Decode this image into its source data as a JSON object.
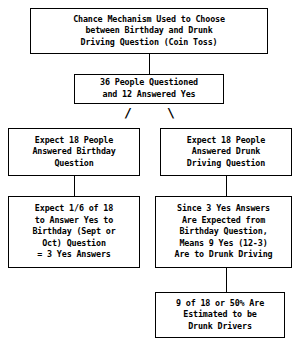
{
  "diagram": {
    "colors": {
      "stroke": "#000000",
      "background": "#ffffff",
      "text": "#000000"
    },
    "nodes": {
      "chance_mechanism": {
        "name": "chance-mechanism",
        "lines": [
          "Chance Mechanism Used to Choose",
          "between Birthday and Drunk",
          "Driving Question (Coin Toss)"
        ]
      },
      "questioned": {
        "name": "people-questioned",
        "lines": [
          "36 People Questioned",
          "and 12 Answered Yes"
        ]
      },
      "expect_birthday": {
        "name": "expect-18-birthday",
        "lines": [
          "Expect 18 People",
          "Answered Birthday",
          "Question"
        ]
      },
      "expect_drunk": {
        "name": "expect-18-drunk-driving",
        "lines": [
          "Expect 18 People",
          "Answered Drunk",
          "Driving Question"
        ]
      },
      "birthday_yes": {
        "name": "birthday-yes-calculation",
        "lines": [
          "Expect 1/6 of 18",
          "to Answer Yes to",
          "Birthday (Sept or",
          "Oct) Question",
          "= 3 Yes Answers"
        ]
      },
      "drunk_yes": {
        "name": "drunk-driving-yes-calculation",
        "lines": [
          "Since 3 Yes Answers",
          "Are Expected from",
          "Birthday Question,",
          "Means 9 Yes (12-3)",
          "Are to Drunk Driving"
        ]
      },
      "result": {
        "name": "final-result",
        "lines": [
          "9 of 18 or 50% Are",
          "Estimated to be",
          "Drunk Drivers"
        ]
      }
    },
    "connectors": {
      "top_vertical": "vertical-line",
      "branch_left": "/",
      "branch_right": "\\",
      "left_vertical": "vertical-line",
      "right_vertical": "vertical-line",
      "right_bottom_vertical": "vertical-line"
    }
  }
}
